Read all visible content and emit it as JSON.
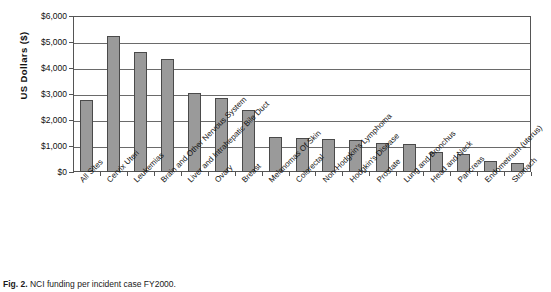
{
  "chart_data": {
    "type": "bar",
    "title": "",
    "xlabel": "",
    "ylabel": "US  Dollars ($)",
    "ylim": [
      0,
      6000
    ],
    "ytick_labels": [
      "$6,000",
      "$5,000",
      "$4,000",
      "$3,000",
      "$2,000",
      "$1,000",
      "$0"
    ],
    "ytick_values": [
      6000,
      5000,
      4000,
      3000,
      2000,
      1000,
      0
    ],
    "grid": true,
    "legend": "none",
    "bar_color": "#9a9a9a",
    "bar_edge_color": "#4a4a4a",
    "categories": [
      "All Sites",
      "Cervix Uteri",
      "Leukemias",
      "Brain and Other Nervous System",
      "Liver and Intrahepatic Bile Duct",
      "Ovary",
      "Breast",
      "Melanomas Of Skin",
      "Colorectal",
      "Non-Hodgkin's Lymphoma",
      "Hodgkin's Disease",
      "Prostate",
      "Lung and Bronchus",
      "Head and Neck",
      "Pancreas",
      "Endometrium (uterus)",
      "Stomach"
    ],
    "values": [
      2760,
      5230,
      4620,
      4350,
      3040,
      2850,
      2400,
      1350,
      1300,
      1280,
      1250,
      1130,
      1060,
      760,
      680,
      430,
      360
    ]
  },
  "caption": {
    "figure_number": "Fig. 2.",
    "text": "NCI funding per incident case FY2000."
  }
}
